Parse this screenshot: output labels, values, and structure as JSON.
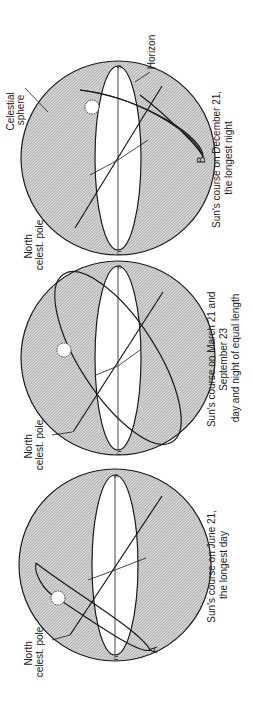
{
  "colors": {
    "sphere_fill": "#c9c9c9",
    "line": "#1a1a1a",
    "horizon_fill": "#ffffff",
    "text": "#222222"
  },
  "panels": [
    {
      "id": "december",
      "caption_line1": "Sun's course on December 21,",
      "caption_line2": "the longest night",
      "labels": {
        "pole": [
          "North",
          "celest. pole"
        ],
        "sphere": [
          "Celestial",
          "sphere"
        ],
        "horizon": "Horizon",
        "point": "B",
        "n": "n",
        "s": "s"
      }
    },
    {
      "id": "equinox",
      "caption_line1": "Sun's course on March 21 and",
      "caption_line2": "September 23",
      "caption_line3": "day and night of equal length",
      "labels": {
        "pole": [
          "North",
          "celest. pole"
        ],
        "n": "n",
        "s": "s"
      }
    },
    {
      "id": "june",
      "caption_line1": "Sun's course on June 21,",
      "caption_line2": "the longest day",
      "labels": {
        "pole": [
          "North",
          "celest. pole"
        ],
        "point": "A",
        "n": "n",
        "s": "s"
      }
    }
  ]
}
